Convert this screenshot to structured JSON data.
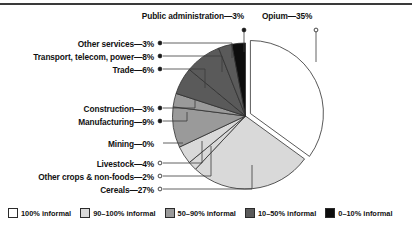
{
  "chart_data": {
    "type": "pie",
    "title": "",
    "subtitle": "",
    "xlabel": "",
    "ylabel": "",
    "legend_position": "bottom",
    "grid": false,
    "units": "percent",
    "total": 100,
    "exploded_slice": "Opium",
    "start_angle_deg": 0,
    "direction": "clockwise",
    "categories": [
      "Opium",
      "Cereals",
      "Other crops & non-foods",
      "Livestock",
      "Mining",
      "Manufacturing",
      "Construction",
      "Trade",
      "Transport, telecom, power",
      "Other services",
      "Public administration"
    ],
    "values": [
      35,
      27,
      2,
      4,
      0,
      9,
      3,
      6,
      8,
      3,
      3
    ],
    "slices": [
      {
        "label": "Opium",
        "value": 35,
        "value_text": "35%",
        "label_text": "Opium—35%",
        "informality": "100% informal",
        "color": "#ffffff",
        "marker": "open",
        "exploded": true
      },
      {
        "label": "Cereals",
        "value": 27,
        "value_text": "27%",
        "label_text": "Cereals—27%",
        "informality": "90–100% informal",
        "color": "#d9d9d9",
        "marker": "open",
        "exploded": false
      },
      {
        "label": "Other crops & non-foods",
        "value": 2,
        "value_text": "2%",
        "label_text": "Other crops & non-foods—2%",
        "informality": "90–100% informal",
        "color": "#d9d9d9",
        "marker": "open",
        "exploded": false
      },
      {
        "label": "Livestock",
        "value": 4,
        "value_text": "4%",
        "label_text": "Livestock—4%",
        "informality": "90–100% informal",
        "color": "#d9d9d9",
        "marker": "open",
        "exploded": false
      },
      {
        "label": "Mining",
        "value": 0,
        "value_text": "0%",
        "label_text": "Mining—0%",
        "informality": "90–100% informal",
        "color": "#d9d9d9",
        "marker": "none",
        "exploded": false
      },
      {
        "label": "Manufacturing",
        "value": 9,
        "value_text": "9%",
        "label_text": "Manufacturing—9%",
        "informality": "50–90% informal",
        "color": "#9a9a9a",
        "marker": "filled",
        "exploded": false
      },
      {
        "label": "Construction",
        "value": 3,
        "value_text": "3%",
        "label_text": "Construction—3%",
        "informality": "50–90% informal",
        "color": "#9a9a9a",
        "marker": "filled",
        "exploded": false
      },
      {
        "label": "Trade",
        "value": 6,
        "value_text": "6%",
        "label_text": "Trade—6%",
        "informality": "10–50% informal",
        "color": "#5a5a5a",
        "marker": "filled",
        "exploded": false
      },
      {
        "label": "Transport, telecom, power",
        "value": 8,
        "value_text": "8%",
        "label_text": "Transport, telecom, power—8%",
        "informality": "10–50% informal",
        "color": "#5a5a5a",
        "marker": "filled",
        "exploded": false
      },
      {
        "label": "Other services",
        "value": 3,
        "value_text": "3%",
        "label_text": "Other services—3%",
        "informality": "10–50% informal",
        "color": "#5a5a5a",
        "marker": "filled",
        "exploded": false
      },
      {
        "label": "Public administration",
        "value": 3,
        "value_text": "3%",
        "label_text": "Public administration—3%",
        "informality": "0–10% informal",
        "color": "#0d0d0d",
        "marker": "filled",
        "exploded": false
      }
    ],
    "legend": {
      "entries": [
        {
          "label": "100% informal",
          "color": "#ffffff"
        },
        {
          "label": "90–100% informal",
          "color": "#d9d9d9"
        },
        {
          "label": "50–90% informal",
          "color": "#9a9a9a"
        },
        {
          "label": "10–50% informal",
          "color": "#5a5a5a"
        },
        {
          "label": "0–10% informal",
          "color": "#0d0d0d"
        }
      ]
    }
  }
}
